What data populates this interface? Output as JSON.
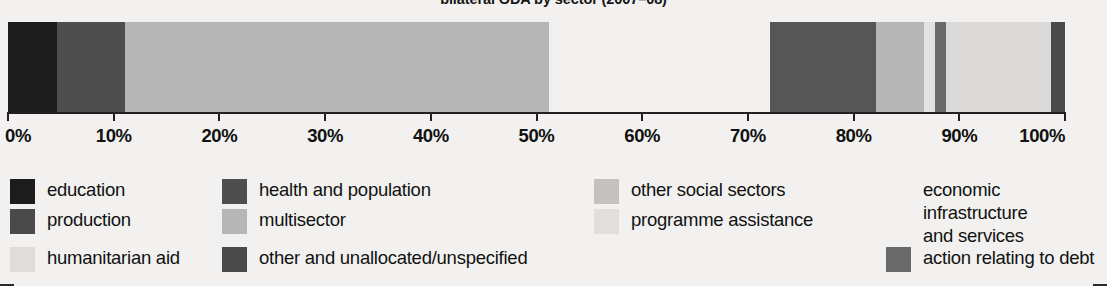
{
  "chart": {
    "title": "bilateral ODA by sector (2007–08)"
  },
  "chart_data": {
    "type": "bar",
    "orientation": "horizontal-stacked",
    "title": "bilateral ODA by sector (2007–08)",
    "xlabel": "",
    "ylabel": "",
    "xlim": [
      0,
      100
    ],
    "grid": false,
    "legend_position": "bottom",
    "tick_labels": [
      "0%",
      "10%",
      "20%",
      "30%",
      "40%",
      "50%",
      "60%",
      "70%",
      "80%",
      "90%",
      "100%"
    ],
    "tick_values": [
      0,
      10,
      20,
      30,
      40,
      50,
      60,
      70,
      80,
      90,
      100
    ],
    "categories": [
      "education",
      "health and population",
      "other social sectors",
      "economic infrastructure and services",
      "production",
      "multisector",
      "programme assistance",
      "humanitarian aid",
      "action relating to debt",
      "other and unallocated/unspecified"
    ],
    "series": [
      {
        "name": "share of bilateral ODA",
        "segments": [
          {
            "label": "education",
            "start": 0.0,
            "end": 4.6,
            "value": 4.6,
            "color": "#1c1c1c"
          },
          {
            "label": "health and population",
            "start": 4.6,
            "end": 11.1,
            "value": 6.5,
            "color": "#4e4e4e"
          },
          {
            "label": "other social sectors",
            "start": 11.1,
            "end": 51.2,
            "value": 40.1,
            "color": "#b6b6b6"
          },
          {
            "label": "economic infrastructure and services",
            "start": 51.2,
            "end": 72.1,
            "value": 20.9,
            "color": "#f1f0ee"
          },
          {
            "label": "production",
            "start": 72.1,
            "end": 82.1,
            "value": 10.0,
            "color": "#565656"
          },
          {
            "label": "multisector",
            "start": 82.1,
            "end": 86.7,
            "value": 4.6,
            "color": "#b6b6b6"
          },
          {
            "label": "programme assistance",
            "start": 86.7,
            "end": 87.7,
            "value": 1.0,
            "color": "#e3e2e0"
          },
          {
            "label": "action relating to debt",
            "start": 87.7,
            "end": 88.7,
            "value": 1.0,
            "color": "#6a6a6a"
          },
          {
            "label": "humanitarian aid",
            "start": 88.7,
            "end": 98.7,
            "value": 10.0,
            "color": "#dbdad8"
          },
          {
            "label": "other and unallocated/unspecified",
            "start": 98.7,
            "end": 100.0,
            "value": 1.3,
            "color": "#4a4a4a"
          }
        ]
      }
    ]
  },
  "legend": {
    "items": [
      {
        "label": "education",
        "color": "#1c1c1c",
        "has_swatch": true,
        "col": 0,
        "row": 0
      },
      {
        "label": "production",
        "color": "#4a4a4a",
        "has_swatch": true,
        "col": 0,
        "row": 1
      },
      {
        "label": "humanitarian aid",
        "color": "#dedddb",
        "has_swatch": true,
        "col": 0,
        "row": 2
      },
      {
        "label": "health and population",
        "color": "#4e4e4e",
        "has_swatch": true,
        "col": 1,
        "row": 0
      },
      {
        "label": "multisector",
        "color": "#b6b6b6",
        "has_swatch": true,
        "col": 1,
        "row": 1
      },
      {
        "label": "other and unallocated/unspecified",
        "color": "#4a4a4a",
        "has_swatch": true,
        "col": 1,
        "row": 2
      },
      {
        "label": "other social sectors",
        "color": "#c3c2c0",
        "has_swatch": true,
        "col": 2,
        "row": 0
      },
      {
        "label": "programme assistance",
        "color": "#e0dfdd",
        "has_swatch": true,
        "col": 2,
        "row": 1
      },
      {
        "label": "economic infrastructure\nand services",
        "color": "#f1f0ee",
        "has_swatch": false,
        "col": 3,
        "row": 0
      },
      {
        "label": "action relating to debt",
        "color": "#6a6a6a",
        "has_swatch": true,
        "col": 3,
        "row": 2
      }
    ]
  }
}
